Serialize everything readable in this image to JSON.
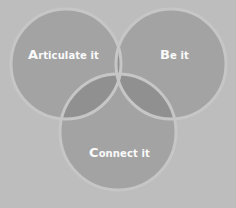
{
  "diagram": {
    "type": "venn",
    "colors": {
      "background": "#bdbdbd",
      "circle": "#a3a3a3",
      "overlap2": "#8f8f8f",
      "overlap3": "#858585",
      "outline": "#c6c6c6",
      "text": "#fafafa"
    },
    "circles": [
      {
        "id": "articulate",
        "cap": "A",
        "rest": "rticulate it",
        "label": "Articulate it"
      },
      {
        "id": "be",
        "cap": "B",
        "rest": "e it",
        "label": "Be it"
      },
      {
        "id": "connect",
        "cap": "C",
        "rest": "onnect it",
        "label": "Connect it"
      }
    ]
  }
}
